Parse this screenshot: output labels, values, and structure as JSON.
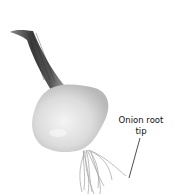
{
  "diagram": {
    "subject": "onion",
    "labels": [
      {
        "text_line1": "Onion root",
        "text_line2": "tip",
        "target": "root-tip"
      }
    ],
    "colors": {
      "background": "#ffffff",
      "bulb": "#d6d6d6",
      "bulb_highlight": "#f0f0f0",
      "stalk_dark": "#3a3a3a",
      "stalk_mid": "#7a7a7a",
      "roots": "#9a9a9a",
      "leader_line": "#222222"
    }
  }
}
